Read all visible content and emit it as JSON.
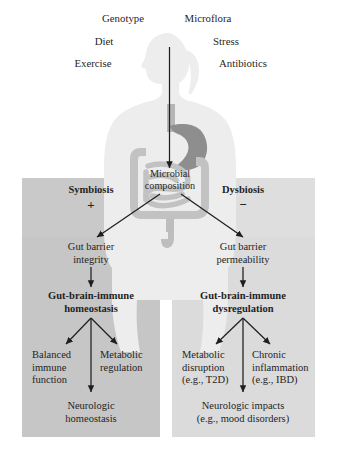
{
  "figure": {
    "colors": {
      "panel_left_bg": "#c9c9c9",
      "panel_right_bg": "#dcdcdc",
      "body_silhouette": "#ededed",
      "stomach": "#8e8e8e",
      "intestine": "#c2c2c2",
      "arrow": "#1f1f1f",
      "text": "#1f1f1f"
    }
  },
  "influences": {
    "row1": [
      {
        "label": "Genotype"
      },
      {
        "label": "Microflora"
      }
    ],
    "row2": [
      {
        "label": "Diet"
      },
      {
        "label": "Stress"
      }
    ],
    "row3": [
      {
        "label": "Exercise"
      },
      {
        "label": "Antibiotics"
      }
    ]
  },
  "center": {
    "microbial_line1": "Microbial",
    "microbial_line2": "composition"
  },
  "branches": {
    "left": {
      "name": "Symbiosis",
      "sign": "+",
      "barrier_line1": "Gut barrier",
      "barrier_line2": "integrity",
      "state_line1": "Gut-brain-immune",
      "state_line2": "homeostasis",
      "outcome_a_line1": "Balanced",
      "outcome_a_line2": "immune",
      "outcome_a_line3": "function",
      "outcome_b_line1": "Metabolic",
      "outcome_b_line2": "regulation",
      "final_line1": "Neurologic",
      "final_line2": "homeostasis"
    },
    "right": {
      "name": "Dysbiosis",
      "sign": "−",
      "barrier_line1": "Gut barrier",
      "barrier_line2": "permeability",
      "state_line1": "Gut-brain-immune",
      "state_line2": "dysregulation",
      "outcome_a_line1": "Metabolic",
      "outcome_a_line2": "disruption",
      "outcome_a_line3": "(e.g., T2D)",
      "outcome_b_line1": "Chronic",
      "outcome_b_line2": "inflammation",
      "outcome_b_line3": "(e.g., IBD)",
      "final_line1": "Neurologic impacts",
      "final_line2": "(e.g., mood disorders)"
    }
  }
}
